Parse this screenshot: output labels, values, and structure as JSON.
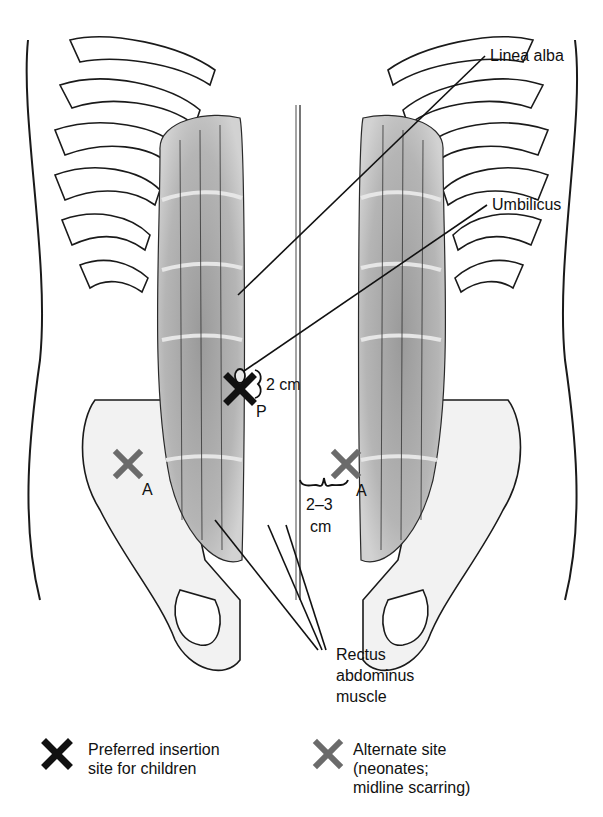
{
  "figure": {
    "labels": {
      "linea_alba": "Linea alba",
      "umbilicus": "Umbilicus",
      "two_cm": "2 cm",
      "preferred_marker": "P",
      "alternate_marker_left": "A",
      "alternate_marker_right": "A",
      "two_three_cm_line1": "2–3",
      "two_three_cm_line2": "cm",
      "rectus_line1": "Rectus",
      "rectus_line2": "abdominus",
      "rectus_line3": "muscle"
    },
    "colors": {
      "preferred_x": "#111111",
      "alternate_x": "#6b6b6b",
      "muscle": "#a9a9a9",
      "bone_fill": "#f2f2f2",
      "outline": "#1a1a1a"
    }
  },
  "legend": {
    "items": [
      {
        "icon": "black-x-icon",
        "lines": [
          "Preferred insertion",
          "site for children"
        ]
      },
      {
        "icon": "gray-x-icon",
        "lines": [
          "Alternate site",
          "(neonates;",
          "midline scarring)"
        ]
      }
    ]
  }
}
